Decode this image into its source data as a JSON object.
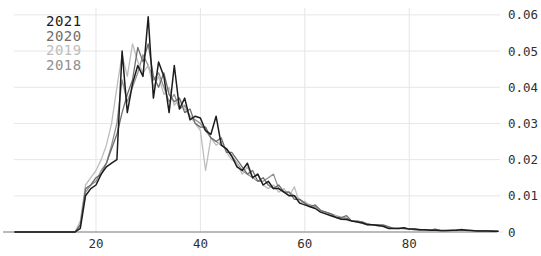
{
  "chart_data": {
    "type": "line",
    "title": "",
    "xlabel": "",
    "ylabel": "",
    "xlim": [
      4.3,
      96.8
    ],
    "ylim": [
      0,
      0.0619
    ],
    "grid": true,
    "legend_position": "top-left-inside",
    "xticks": {
      "values": [
        20,
        40,
        60,
        80
      ],
      "labels": [
        "20",
        "40",
        "60",
        "80"
      ]
    },
    "yticks": {
      "values": [
        0,
        0.01,
        0.02,
        0.03,
        0.04,
        0.05,
        0.06
      ],
      "labels": [
        "0",
        "0.01",
        "0.02",
        "0.03",
        "0.04",
        "0.05",
        "0.06"
      ]
    },
    "colors": {
      "background": "#ffffff",
      "grid": "#e6e6e6",
      "axis_line": "#a3a3a3",
      "tick_label": "#303030"
    },
    "x": [
      4.5,
      10,
      15,
      16,
      17,
      18,
      19,
      20,
      21,
      22,
      23,
      24,
      25,
      26,
      27,
      28,
      29,
      30,
      31,
      32,
      33,
      34,
      35,
      36,
      37,
      38,
      39,
      40,
      41,
      42,
      43,
      44,
      45,
      46,
      47,
      48,
      49,
      50,
      51,
      52,
      53,
      54,
      55,
      56,
      57,
      58,
      59,
      60,
      61,
      62,
      63,
      64,
      65,
      66,
      67,
      68,
      69,
      70,
      71,
      72,
      73,
      74,
      75,
      76,
      77,
      78,
      79,
      80,
      81,
      82,
      83,
      84,
      85,
      86,
      87,
      88,
      89,
      90,
      91,
      92,
      93,
      94,
      95,
      96,
      97
    ],
    "series": [
      {
        "name": "2021",
        "color": "#1c1c1c",
        "width": 1.5,
        "values": [
          0,
          0,
          0,
          0,
          0.001,
          0.01,
          0.012,
          0.013,
          0.016,
          0.018,
          0.019,
          0.02,
          0.05,
          0.033,
          0.041,
          0.046,
          0.043,
          0.0595,
          0.037,
          0.047,
          0.043,
          0.033,
          0.046,
          0.034,
          0.037,
          0.031,
          0.032,
          0.0315,
          0.028,
          0.027,
          0.032,
          0.024,
          0.023,
          0.021,
          0.018,
          0.017,
          0.019,
          0.015,
          0.016,
          0.013,
          0.014,
          0.012,
          0.012,
          0.011,
          0.01,
          0.01,
          0.008,
          0.0075,
          0.007,
          0.0065,
          0.0055,
          0.005,
          0.0045,
          0.004,
          0.0035,
          0.0035,
          0.003,
          0.0028,
          0.0025,
          0.002,
          0.002,
          0.0018,
          0.0016,
          0.001,
          0.001,
          0.001,
          0.0012,
          0.0008,
          0.0008,
          0.0006,
          0.0006,
          0.0005,
          0.0005,
          0.0004,
          0.0004,
          0.0005,
          0.0005,
          0.0006,
          0.0005,
          0.0004,
          0.0003,
          0.0003,
          0.0003,
          0.0002,
          0.0002
        ]
      },
      {
        "name": "2020",
        "color": "#6e6e6e",
        "width": 1.3,
        "values": [
          0,
          0,
          0,
          0,
          0.002,
          0.012,
          0.013,
          0.015,
          0.016,
          0.019,
          0.023,
          0.027,
          0.033,
          0.038,
          0.042,
          0.051,
          0.047,
          0.052,
          0.043,
          0.04,
          0.044,
          0.038,
          0.036,
          0.037,
          0.033,
          0.034,
          0.03,
          0.029,
          0.029,
          0.026,
          0.025,
          0.026,
          0.022,
          0.022,
          0.02,
          0.018,
          0.016,
          0.017,
          0.014,
          0.015,
          0.013,
          0.012,
          0.013,
          0.011,
          0.011,
          0.009,
          0.009,
          0.008,
          0.007,
          0.0075,
          0.006,
          0.0055,
          0.005,
          0.004,
          0.004,
          0.0045,
          0.003,
          0.003,
          0.0028,
          0.0022,
          0.002,
          0.002,
          0.002,
          0.0015,
          0.001,
          0.001,
          0.001,
          0.0008,
          0.0007,
          0.0006,
          0.0006,
          0.0005,
          0.0008,
          0.0004,
          0.0004,
          0.0004,
          0.0005,
          0.0007,
          0.0005,
          0.0004,
          0.0004,
          0.0003,
          0.0003,
          0.0003,
          0.0002
        ]
      },
      {
        "name": "2019",
        "color": "#bdbdbd",
        "width": 1.3,
        "values": [
          0,
          0,
          0,
          0,
          0.003,
          0.013,
          0.015,
          0.017,
          0.02,
          0.024,
          0.03,
          0.04,
          0.049,
          0.043,
          0.052,
          0.047,
          0.044,
          0.046,
          0.04,
          0.043,
          0.038,
          0.04,
          0.035,
          0.037,
          0.034,
          0.032,
          0.03,
          0.028,
          0.017,
          0.026,
          0.024,
          0.025,
          0.022,
          0.02,
          0.019,
          0.016,
          0.018,
          0.015,
          0.016,
          0.013,
          0.012,
          0.013,
          0.011,
          0.012,
          0.01,
          0.0125,
          0.008,
          0.0085,
          0.007,
          0.0065,
          0.006,
          0.005,
          0.0045,
          0.0045,
          0.0035,
          0.0032,
          0.003,
          0.0028,
          0.0024,
          0.002,
          0.002,
          0.0016,
          0.0015,
          0.001,
          0.001,
          0.0009,
          0.0008,
          0.0008,
          0.0007,
          0.0006,
          0.0005,
          0.0005,
          0.0004,
          0.0004,
          0.0003,
          0.0003,
          0.0004,
          0.0005,
          0.0004,
          0.0003,
          0.0003,
          0.0003,
          0.0002,
          0.0002,
          0.0002
        ]
      },
      {
        "name": "2018",
        "color": "#909090",
        "width": 1.3,
        "values": [
          0,
          0,
          0,
          0,
          0.002,
          0.011,
          0.013,
          0.014,
          0.017,
          0.019,
          0.024,
          0.03,
          0.042,
          0.036,
          0.04,
          0.044,
          0.049,
          0.046,
          0.042,
          0.044,
          0.04,
          0.036,
          0.038,
          0.034,
          0.035,
          0.032,
          0.031,
          0.03,
          0.028,
          0.026,
          0.025,
          0.024,
          0.023,
          0.021,
          0.019,
          0.017,
          0.016,
          0.015,
          0.014,
          0.014,
          0.015,
          0.016,
          0.012,
          0.011,
          0.011,
          0.01,
          0.009,
          0.008,
          0.0075,
          0.007,
          0.006,
          0.0055,
          0.005,
          0.0045,
          0.004,
          0.0038,
          0.003,
          0.003,
          0.0027,
          0.0022,
          0.002,
          0.002,
          0.0016,
          0.0012,
          0.001,
          0.001,
          0.001,
          0.0008,
          0.0007,
          0.0007,
          0.0006,
          0.0005,
          0.0007,
          0.0004,
          0.0004,
          0.0004,
          0.0004,
          0.0006,
          0.0004,
          0.0004,
          0.0003,
          0.0003,
          0.0003,
          0.0002,
          0.0002
        ]
      }
    ]
  }
}
